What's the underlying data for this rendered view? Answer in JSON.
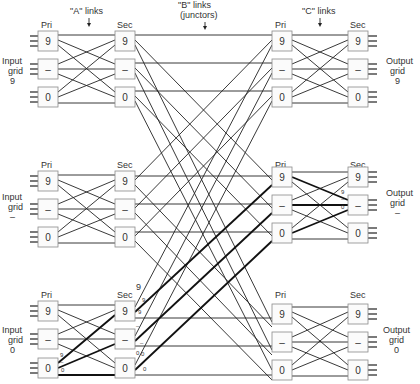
{
  "figure": {
    "type": "switching-network-diagram",
    "headers": {
      "a_links": "\"A\" links",
      "b_links_line1": "\"B\" links",
      "b_links_line2": "(junctors)",
      "c_links": "\"C\" links"
    },
    "column_labels": {
      "primary": "Pri",
      "secondary": "Sec"
    },
    "input_grids": [
      {
        "line1": "Input",
        "line2": "grid",
        "line3": "9"
      },
      {
        "line1": "Input",
        "line2": "grid",
        "line3": "–"
      },
      {
        "line1": "Input",
        "line2": "grid",
        "line3": "0"
      }
    ],
    "output_grids": [
      {
        "line1": "Output",
        "line2": "grid",
        "line3": "9"
      },
      {
        "line1": "Output",
        "line2": "grid",
        "line3": "–"
      },
      {
        "line1": "Output",
        "line2": "grid",
        "line3": "0"
      }
    ],
    "switch_labels": [
      "9",
      "–",
      "0"
    ],
    "link_annotations": {
      "input_grid_0_pri_0": [
        "9",
        "–",
        "0"
      ],
      "input_grid_0_sec": [
        "9",
        "9",
        "9",
        "–",
        "–",
        "0",
        "0",
        "0"
      ],
      "output_grid_dash_sec_dash": [
        "9",
        "–",
        "0"
      ]
    }
  }
}
